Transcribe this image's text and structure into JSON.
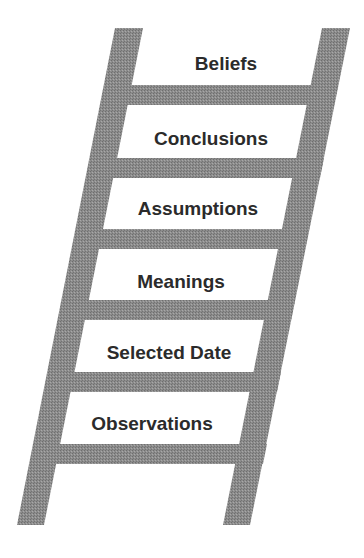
{
  "diagram": {
    "type": "ladder",
    "colors": {
      "rail": "#8c8c8c",
      "rail_dark": "#7a7a7a",
      "rung": "#8c8c8c",
      "text": "#2b2b2b",
      "background": "#ffffff"
    },
    "steps_top_to_bottom": [
      {
        "label": "Beliefs"
      },
      {
        "label": "Conclusions"
      },
      {
        "label": "Assumptions"
      },
      {
        "label": "Meanings"
      },
      {
        "label": "Selected Date"
      },
      {
        "label": "Observations"
      }
    ]
  }
}
